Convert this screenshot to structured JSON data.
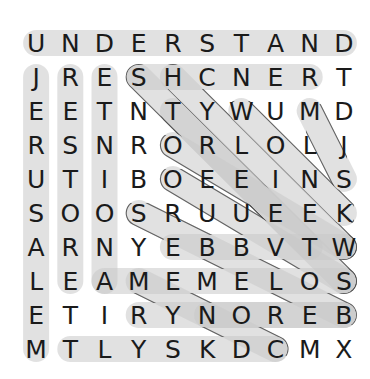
{
  "puzzle": {
    "type": "word-search",
    "rows": 10,
    "cols": 10,
    "grid": [
      [
        "U",
        "N",
        "D",
        "E",
        "R",
        "S",
        "T",
        "A",
        "N",
        "D"
      ],
      [
        "J",
        "R",
        "E",
        "S",
        "H",
        "C",
        "N",
        "E",
        "R",
        "T"
      ],
      [
        "E",
        "E",
        "T",
        "N",
        "T",
        "Y",
        "W",
        "U",
        "M",
        "D"
      ],
      [
        "R",
        "S",
        "N",
        "R",
        "O",
        "R",
        "L",
        "O",
        "L",
        "J"
      ],
      [
        "U",
        "T",
        "I",
        "B",
        "O",
        "E",
        "E",
        "I",
        "N",
        "S"
      ],
      [
        "S",
        "O",
        "O",
        "S",
        "R",
        "U",
        "U",
        "E",
        "E",
        "K"
      ],
      [
        "A",
        "R",
        "N",
        "Y",
        "E",
        "B",
        "B",
        "V",
        "T",
        "W"
      ],
      [
        "L",
        "E",
        "A",
        "M",
        "E",
        "M",
        "E",
        "L",
        "O",
        "S"
      ],
      [
        "E",
        "T",
        "I",
        "R",
        "Y",
        "N",
        "O",
        "R",
        "E",
        "B"
      ],
      [
        "M",
        "T",
        "L",
        "Y",
        "S",
        "K",
        "D",
        "C",
        "M",
        "X"
      ]
    ],
    "geometry": {
      "origin_x": 19,
      "origin_y": 26,
      "cell_w": 34.2,
      "cell_h": 34.0,
      "capsule_thickness": 26,
      "capsule_fill": "#cccccc",
      "capsule_stroke": "#555555",
      "capsule_fill_opacity": 0.55
    },
    "colors": {
      "background": "#ffffff",
      "letter": "#1a1a1a",
      "highlight_fill": "#c9c9c9",
      "highlight_stroke": "#4d4d4d"
    },
    "found_words": [
      {
        "text": "UNDERSTAND",
        "start": [
          0,
          0
        ],
        "end": [
          0,
          9
        ],
        "direction": "horizontal"
      },
      {
        "text": "JERUSALEM",
        "start": [
          1,
          0
        ],
        "end": [
          9,
          0
        ],
        "direction": "vertical"
      },
      {
        "text": "RESTORE",
        "start": [
          1,
          1
        ],
        "end": [
          7,
          1
        ],
        "direction": "vertical"
      },
      {
        "text": "ETNIONA",
        "start": [
          1,
          2
        ],
        "end": [
          7,
          2
        ],
        "direction": "vertical"
      },
      {
        "text": "SHCNER",
        "start": [
          1,
          3
        ],
        "end": [
          1,
          8
        ],
        "direction": "horizontal"
      },
      {
        "text": "STNUMD",
        "start": [
          1,
          3
        ],
        "end": [
          6,
          8
        ],
        "direction": "diagonal-down-right"
      },
      {
        "text": "ETYOIS",
        "start": [
          1,
          4
        ],
        "end": [
          6,
          9
        ],
        "direction": "diagonal-down-right"
      },
      {
        "text": "TROEUS",
        "start": [
          2,
          4
        ],
        "end": [
          7,
          9
        ],
        "direction": "diagonal-down-right"
      },
      {
        "text": "WULOEK",
        "start": [
          2,
          6
        ],
        "end": [
          5,
          9
        ],
        "direction": "diagonal-down-right"
      },
      {
        "text": "MDJS",
        "start": [
          2,
          8
        ],
        "end": [
          4,
          9
        ],
        "direction": "diagonal-down-right"
      },
      {
        "text": "ROLIEW",
        "start": [
          3,
          4
        ],
        "end": [
          6,
          9
        ],
        "direction": "diagonal-down-right"
      },
      {
        "text": "OEEINS",
        "start": [
          4,
          4
        ],
        "end": [
          7,
          9
        ],
        "direction": "diagonal-down-right"
      },
      {
        "text": "SRUUEK",
        "start": [
          5,
          3
        ],
        "end": [
          8,
          9
        ],
        "direction": "diagonal-down-right"
      },
      {
        "text": "AMEMELOS",
        "start": [
          7,
          2
        ],
        "end": [
          7,
          9
        ],
        "direction": "horizontal"
      },
      {
        "text": "RYNOREB",
        "start": [
          8,
          3
        ],
        "end": [
          8,
          9
        ],
        "direction": "horizontal"
      },
      {
        "text": "TLYSKDC",
        "start": [
          9,
          1
        ],
        "end": [
          9,
          7
        ],
        "direction": "diagonal-up-right"
      },
      {
        "text": "EBBVTW",
        "start": [
          6,
          4
        ],
        "end": [
          6,
          9
        ],
        "direction": "diagonal-down-right"
      },
      {
        "text": "MEMELO",
        "start": [
          7,
          3
        ],
        "end": [
          9,
          7
        ],
        "direction": "diagonal-down-right"
      },
      {
        "text": "NOREB",
        "start": [
          8,
          5
        ],
        "end": [
          8,
          9
        ],
        "direction": "diagonal-up-right"
      }
    ]
  }
}
